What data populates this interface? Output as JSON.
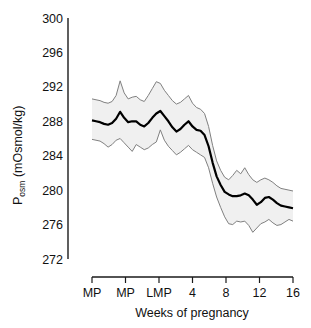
{
  "chart_data": {
    "type": "line",
    "title": "",
    "xlabel": "Weeks of pregnancy",
    "ylabel": "P_osm (mOsmol/kg)",
    "ylabel_base": "P",
    "ylabel_sub": "osm",
    "ylabel_rest": " (mOsmol/kg)",
    "ylim": [
      272,
      300
    ],
    "yticks": [
      272,
      276,
      280,
      284,
      288,
      292,
      296,
      300
    ],
    "ytick_labels": [
      "272",
      "276",
      "280",
      "284",
      "288",
      "292",
      "296",
      "300"
    ],
    "xticks": [
      0,
      1,
      2,
      3,
      4,
      5,
      6
    ],
    "xtick_labels": [
      "MP",
      "MP",
      "LMP",
      "4",
      "8",
      "12",
      "16"
    ],
    "xlim": [
      0,
      6
    ],
    "grid": false,
    "legend": false,
    "band_fill_color": "#f0f0f0",
    "band_line_color": "#808080",
    "mean_line_color": "#000000",
    "axis_color": "#1a1a1a",
    "series": [
      {
        "name": "Mean plasma osmolality",
        "x": [
          0.0,
          0.12,
          0.24,
          0.36,
          0.48,
          0.6,
          0.72,
          0.84,
          0.96,
          1.08,
          1.2,
          1.32,
          1.44,
          1.56,
          1.68,
          1.8,
          1.92,
          2.04,
          2.16,
          2.28,
          2.4,
          2.52,
          2.64,
          2.76,
          2.88,
          3.0,
          3.12,
          3.24,
          3.36,
          3.48,
          3.6,
          3.72,
          3.84,
          3.96,
          4.08,
          4.2,
          4.32,
          4.44,
          4.56,
          4.68,
          4.8,
          4.92,
          5.04,
          5.16,
          5.28,
          5.4,
          5.52,
          5.64,
          5.76,
          5.88,
          6.0
        ],
        "values": [
          288.1,
          288.0,
          287.9,
          287.7,
          287.6,
          287.8,
          288.3,
          289.1,
          288.4,
          287.9,
          288.0,
          288.0,
          287.6,
          287.4,
          287.8,
          288.4,
          288.9,
          289.2,
          288.6,
          288.0,
          287.3,
          286.8,
          287.1,
          287.6,
          288.0,
          287.4,
          287.0,
          286.9,
          286.4,
          285.1,
          283.2,
          281.6,
          280.6,
          279.8,
          279.5,
          279.3,
          279.3,
          279.4,
          279.6,
          279.4,
          278.9,
          278.3,
          278.6,
          279.1,
          279.2,
          278.9,
          278.5,
          278.2,
          278.1,
          278.0,
          277.9
        ]
      },
      {
        "name": "Upper confidence bound",
        "x": [
          0.0,
          0.12,
          0.24,
          0.36,
          0.48,
          0.6,
          0.72,
          0.84,
          0.96,
          1.08,
          1.2,
          1.32,
          1.44,
          1.56,
          1.68,
          1.8,
          1.92,
          2.04,
          2.16,
          2.28,
          2.4,
          2.52,
          2.64,
          2.76,
          2.88,
          3.0,
          3.12,
          3.24,
          3.36,
          3.48,
          3.6,
          3.72,
          3.84,
          3.96,
          4.08,
          4.2,
          4.32,
          4.44,
          4.56,
          4.68,
          4.8,
          4.92,
          5.04,
          5.16,
          5.28,
          5.4,
          5.52,
          5.64,
          5.76,
          5.88,
          6.0
        ],
        "values": [
          290.6,
          290.5,
          290.4,
          290.2,
          290.1,
          290.3,
          291.0,
          292.7,
          291.3,
          290.6,
          290.8,
          290.9,
          290.5,
          290.3,
          291.0,
          291.8,
          292.6,
          292.4,
          291.6,
          291.0,
          290.4,
          290.0,
          290.2,
          290.6,
          291.0,
          290.1,
          289.6,
          289.4,
          288.9,
          287.4,
          285.2,
          283.4,
          282.3,
          281.5,
          281.2,
          281.7,
          282.3,
          281.9,
          282.6,
          281.8,
          281.2,
          280.9,
          281.2,
          281.4,
          281.2,
          280.9,
          280.5,
          280.2,
          280.1,
          280.0,
          279.9
        ]
      },
      {
        "name": "Lower confidence bound",
        "x": [
          0.0,
          0.12,
          0.24,
          0.36,
          0.48,
          0.6,
          0.72,
          0.84,
          0.96,
          1.08,
          1.2,
          1.32,
          1.44,
          1.56,
          1.68,
          1.8,
          1.92,
          2.04,
          2.16,
          2.28,
          2.4,
          2.52,
          2.64,
          2.76,
          2.88,
          3.0,
          3.12,
          3.24,
          3.36,
          3.48,
          3.6,
          3.72,
          3.84,
          3.96,
          4.08,
          4.2,
          4.32,
          4.44,
          4.56,
          4.68,
          4.8,
          4.92,
          5.04,
          5.16,
          5.28,
          5.4,
          5.52,
          5.64,
          5.76,
          5.88,
          6.0
        ],
        "values": [
          285.9,
          285.8,
          285.7,
          285.4,
          285.0,
          285.3,
          285.8,
          286.0,
          285.5,
          285.0,
          284.5,
          285.3,
          285.0,
          284.7,
          284.9,
          285.3,
          285.6,
          287.0,
          285.8,
          285.1,
          284.6,
          284.1,
          284.4,
          284.8,
          285.2,
          284.7,
          284.4,
          284.1,
          283.8,
          282.6,
          280.8,
          279.2,
          278.0,
          276.9,
          276.1,
          276.0,
          276.4,
          276.3,
          276.4,
          275.9,
          275.1,
          275.6,
          276.1,
          276.3,
          276.6,
          276.2,
          275.9,
          276.0,
          276.3,
          276.6,
          276.4
        ]
      }
    ]
  }
}
